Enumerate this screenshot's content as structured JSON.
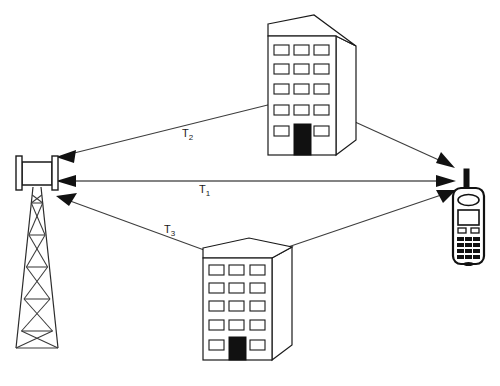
{
  "diagram": {
    "background_color": "#ffffff",
    "line_color": "#3d3d3d",
    "fill_color": "#ffffff",
    "accent_color": "#111111",
    "width": 500,
    "height": 386
  },
  "labels": {
    "t1": {
      "base": "T",
      "sub": "1"
    },
    "t2": {
      "base": "T",
      "sub": "2"
    },
    "t3": {
      "base": "T",
      "sub": "3"
    }
  },
  "paths": [
    {
      "id": "t1",
      "label": "T1",
      "kind": "direct",
      "description": "Direct line-of-sight path from tower antenna to mobile phone",
      "arrows": "both"
    },
    {
      "id": "t2",
      "label": "T2",
      "kind": "reflected",
      "description": "Reflected path via upper building",
      "arrows": "both"
    },
    {
      "id": "t3",
      "label": "T3",
      "kind": "reflected",
      "description": "Reflected path via lower building",
      "arrows": "both"
    }
  ],
  "nodes": {
    "tower": {
      "name": "base-station-tower",
      "segments": 5
    },
    "phone": {
      "name": "mobile-phone",
      "keypad_rows": 4,
      "keypad_cols": 3
    },
    "building_upper": {
      "name": "upper-building",
      "window_rows": 5,
      "window_cols": 3,
      "has_door": true
    },
    "building_lower": {
      "name": "lower-building",
      "window_rows": 5,
      "window_cols": 3,
      "has_door": true
    }
  }
}
